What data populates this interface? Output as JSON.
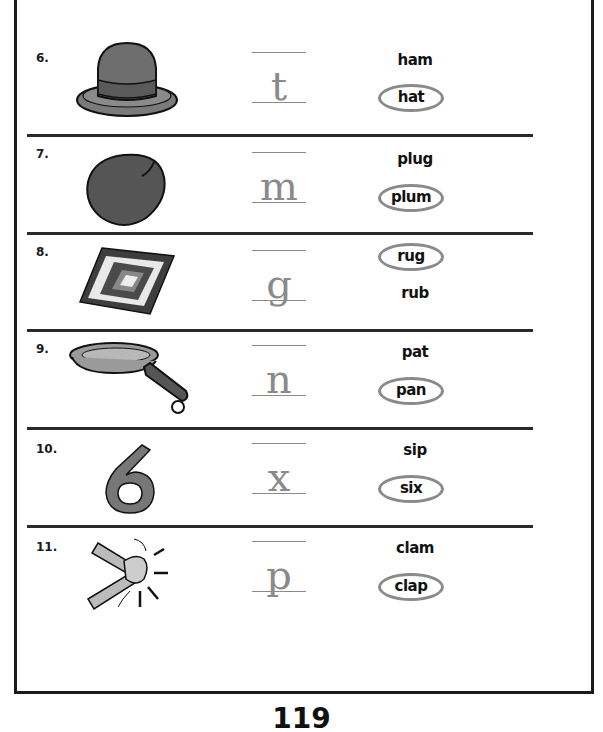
{
  "worksheet": {
    "items": [
      {
        "number": "6.",
        "picture": "hat",
        "letter": "t",
        "words": [
          {
            "text": "ham",
            "circled": false
          },
          {
            "text": "hat",
            "circled": true
          }
        ]
      },
      {
        "number": "7.",
        "picture": "plum",
        "letter": "m",
        "words": [
          {
            "text": "plug",
            "circled": false
          },
          {
            "text": "plum",
            "circled": true
          }
        ]
      },
      {
        "number": "8.",
        "picture": "rug",
        "letter": "g",
        "words": [
          {
            "text": "rug",
            "circled": true
          },
          {
            "text": "rub",
            "circled": false
          }
        ]
      },
      {
        "number": "9.",
        "picture": "pan",
        "letter": "n",
        "words": [
          {
            "text": "pat",
            "circled": false
          },
          {
            "text": "pan",
            "circled": true
          }
        ]
      },
      {
        "number": "10.",
        "picture": "six",
        "letter": "x",
        "words": [
          {
            "text": "sip",
            "circled": false
          },
          {
            "text": "six",
            "circled": true
          }
        ]
      },
      {
        "number": "11.",
        "picture": "clap",
        "letter": "p",
        "words": [
          {
            "text": "clam",
            "circled": false
          },
          {
            "text": "clap",
            "circled": true
          }
        ]
      }
    ],
    "page_number": "119"
  },
  "colors": {
    "ink": "#111111",
    "picture_fill": "#6e6e6e",
    "trace_gray": "#8a8a8a",
    "circle_gray": "#8a8a8a"
  }
}
